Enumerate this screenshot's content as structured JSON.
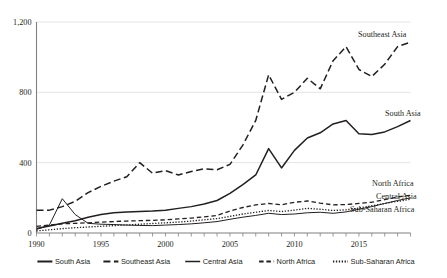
{
  "chart_data": {
    "type": "line",
    "title": "",
    "subtitle": "",
    "xlabel": "",
    "ylabel": "",
    "xlim": [
      1990,
      2019
    ],
    "ylim": [
      0,
      1200
    ],
    "yticks": [
      0,
      400,
      800,
      1200
    ],
    "ytick_labels": [
      "0",
      "400",
      "800",
      "1,200"
    ],
    "xticks": [
      1990,
      1991,
      1992,
      1993,
      1994,
      1995,
      1996,
      1997,
      1998,
      1999,
      2000,
      2001,
      2002,
      2003,
      2004,
      2005,
      2006,
      2007,
      2008,
      2009,
      2010,
      2011,
      2012,
      2013,
      2014,
      2015,
      2016,
      2017,
      2018,
      2019
    ],
    "xtick_labels_shown": [
      "1990",
      "1995",
      "2000",
      "2005",
      "2010",
      "2015"
    ],
    "grid": "horizontal",
    "legend_position": "bottom",
    "x": [
      1990,
      1991,
      1992,
      1993,
      1994,
      1995,
      1996,
      1997,
      1998,
      1999,
      2000,
      2001,
      2002,
      2003,
      2004,
      2005,
      2006,
      2007,
      2008,
      2009,
      2010,
      2011,
      2012,
      2013,
      2014,
      2015,
      2016,
      2017,
      2018,
      2019
    ],
    "series": [
      {
        "name": "South Asia",
        "style": "solid",
        "end_label": "South Asia",
        "values": [
          25,
          40,
          55,
          70,
          90,
          105,
          115,
          120,
          122,
          125,
          130,
          140,
          150,
          165,
          185,
          225,
          275,
          330,
          480,
          370,
          470,
          540,
          570,
          620,
          640,
          565,
          560,
          575,
          605,
          640
        ]
      },
      {
        "name": "Southeast Asia",
        "style": "dashed-long",
        "end_label": "Southeast Asia",
        "values": [
          130,
          130,
          150,
          180,
          230,
          265,
          295,
          320,
          400,
          340,
          355,
          330,
          350,
          365,
          360,
          390,
          500,
          640,
          900,
          760,
          800,
          880,
          820,
          980,
          1060,
          930,
          890,
          960,
          1060,
          1085
        ]
      },
      {
        "name": "Central Asia",
        "style": "solid-thin",
        "end_label": "Central Asia",
        "values": [
          20,
          45,
          195,
          105,
          55,
          50,
          48,
          45,
          43,
          42,
          45,
          48,
          52,
          58,
          65,
          78,
          90,
          100,
          112,
          105,
          108,
          115,
          118,
          112,
          120,
          135,
          150,
          168,
          185,
          200
        ]
      },
      {
        "name": "North Africa",
        "style": "dashed-short",
        "end_label": "North Africa",
        "values": [
          38,
          45,
          52,
          55,
          58,
          62,
          65,
          68,
          70,
          72,
          75,
          80,
          85,
          92,
          100,
          125,
          145,
          160,
          168,
          160,
          175,
          182,
          170,
          160,
          162,
          168,
          175,
          190,
          205,
          215
        ]
      },
      {
        "name": "Sub-Saharan Africa",
        "style": "dotted",
        "end_label": "Sub-Saharan Africa",
        "values": [
          12,
          18,
          25,
          30,
          34,
          38,
          42,
          46,
          50,
          54,
          58,
          62,
          68,
          75,
          82,
          95,
          108,
          118,
          128,
          122,
          130,
          140,
          135,
          128,
          132,
          142,
          155,
          168,
          180,
          192
        ]
      }
    ],
    "legend": [
      {
        "label": "South Asia",
        "style": "solid"
      },
      {
        "label": "Southeast Asia",
        "style": "dashed-long"
      },
      {
        "label": "Central Asia",
        "style": "solid-thin"
      },
      {
        "label": "North Africa",
        "style": "dashed-short"
      },
      {
        "label": "Sub-Saharan Africa",
        "style": "dotted"
      }
    ],
    "colors": {
      "line": "#231f20",
      "grid": "#d9d9d9",
      "axis": "#808080",
      "background": "#ffffff"
    }
  }
}
